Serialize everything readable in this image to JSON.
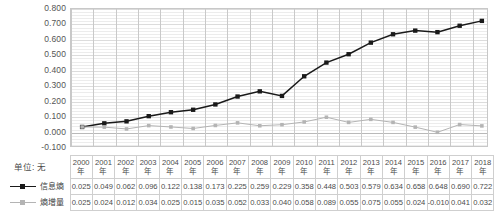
{
  "unit_label": "单位: 无",
  "axis": {
    "yticks": [
      "0.800",
      "0.700",
      "0.600",
      "0.500",
      "0.400",
      "0.300",
      "0.200",
      "0.100",
      "0.000",
      "-0.100"
    ],
    "ymin": -0.1,
    "ymax": 0.8,
    "ystep": 0.1,
    "year_suffix": "年"
  },
  "legend": [
    {
      "name": "series-1",
      "label": "信息熵",
      "color": "#1a1a1a",
      "marker": "square"
    },
    {
      "name": "series-2",
      "label": "熵增量",
      "color": "#b4b4b4",
      "marker": "square"
    }
  ],
  "chart_data": {
    "type": "line",
    "title": "",
    "xlabel": "",
    "ylabel": "",
    "ylim": [
      -0.1,
      0.8
    ],
    "grid": true,
    "legend_position": "bottom-table",
    "categories": [
      "2000",
      "2001",
      "2002",
      "2003",
      "2004",
      "2005",
      "2006",
      "2007",
      "2008",
      "2009",
      "2010",
      "2011",
      "2012",
      "2013",
      "2014",
      "2015",
      "2016",
      "2017",
      "2018"
    ],
    "series": [
      {
        "name": "信息熵",
        "color": "#1a1a1a",
        "values": [
          0.025,
          0.049,
          0.062,
          0.096,
          0.122,
          0.138,
          0.173,
          0.225,
          0.259,
          0.229,
          0.358,
          0.448,
          0.503,
          0.579,
          0.634,
          0.658,
          0.648,
          0.69,
          0.722
        ]
      },
      {
        "name": "熵增量",
        "color": "#b4b4b4",
        "values": [
          0.025,
          0.024,
          0.012,
          0.034,
          0.025,
          0.015,
          0.035,
          0.052,
          0.033,
          0.04,
          0.058,
          0.089,
          0.055,
          0.075,
          0.055,
          0.024,
          -0.01,
          0.041,
          0.032
        ]
      }
    ]
  },
  "table": {
    "row_labels": [
      "信息熵",
      "熵增量"
    ],
    "value_strings": [
      [
        "0.025",
        "0.049",
        "0.062",
        "0.096",
        "0.122",
        "0.138",
        "0.173",
        "0.225",
        "0.259",
        "0.229",
        "0.358",
        "0.448",
        "0.503",
        "0.579",
        "0.634",
        "0.658",
        "0.648",
        "0.690",
        "0.722"
      ],
      [
        "0.025",
        "0.024",
        "0.012",
        "0.034",
        "0.025",
        "0.015",
        "0.035",
        "0.052",
        "0.033",
        "0.040",
        "0.058",
        "0.089",
        "0.055",
        "0.075",
        "0.055",
        "0.024",
        "-0.010",
        "0.041",
        "0.032"
      ]
    ]
  }
}
